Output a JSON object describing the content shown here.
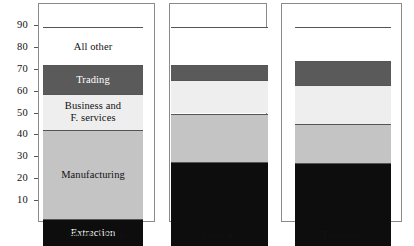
{
  "chart_data": {
    "type": "bar",
    "subtype": "stacked-bar-100",
    "title": "",
    "xlabel": "",
    "ylabel": "",
    "ylim": [
      0,
      100
    ],
    "grid": false,
    "legend_position": "in-bars",
    "categories": [
      "South Africa",
      "Ghana",
      "Tanzania"
    ],
    "y_ticks": [
      10,
      20,
      30,
      40,
      50,
      60,
      70,
      80,
      90
    ],
    "y_tick_labels": [
      "10",
      "20",
      "30",
      "40",
      "50",
      "60",
      "70",
      "80",
      "90"
    ],
    "series": [
      {
        "name": "Extraction",
        "label": "Extraction",
        "color": "#0d0d0d",
        "text_color": "#ffffff",
        "values": [
          12.5,
          38.5,
          38.0
        ]
      },
      {
        "name": "Manufacturing",
        "label": "Manufacturing",
        "color": "#c4c4c4",
        "text_color": "#111111",
        "values": [
          40.5,
          22.0,
          17.5
        ]
      },
      {
        "name": "Business and F. services",
        "label": "Business and\nF. services",
        "color": "#eeeeee",
        "text_color": "#111111",
        "values": [
          16.5,
          15.5,
          18.0
        ]
      },
      {
        "name": "Trading",
        "label": "Trading",
        "color": "#5a5a5a",
        "text_color": "#ffffff",
        "values": [
          13.0,
          6.5,
          11.0
        ]
      },
      {
        "name": "All other",
        "label": "All other",
        "color": "#ffffff",
        "text_color": "#111111",
        "values": [
          17.5,
          17.5,
          15.5
        ]
      }
    ],
    "labeled_bar_index": 0
  },
  "axis": {
    "baseline_value": 0,
    "top_value": 100
  },
  "colors": {
    "panel_border": "#8a8a8a",
    "segment_border": "#555555",
    "text": "#111111",
    "background": "#ffffff"
  }
}
